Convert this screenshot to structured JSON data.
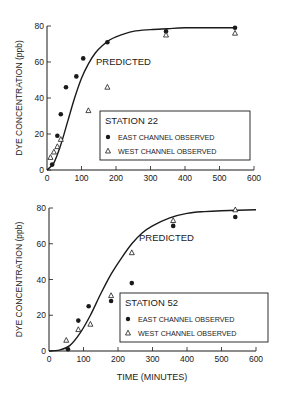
{
  "chart_data": [
    {
      "type": "scatter",
      "title": "STATION 22",
      "xlabel": "",
      "ylabel": "DYE CONCENTRATION (ppb)",
      "xlim": [
        0,
        600
      ],
      "ylim": [
        0,
        80
      ],
      "xticks": [
        "0",
        "100",
        "200",
        "300",
        "400",
        "500",
        "600"
      ],
      "yticks": [
        "0",
        "20",
        "40",
        "60",
        "80"
      ],
      "grid": false,
      "legend_position": "lower right",
      "annotation": "PREDICTED",
      "legend": {
        "title": "STATION 22",
        "east_label": "EAST CHANNEL OBSERVED",
        "west_label": "WEST CHANNEL OBSERVED"
      },
      "series": [
        {
          "name": "EAST CHANNEL OBSERVED",
          "marker": "filled-circle",
          "x": [
            15,
            30,
            40,
            55,
            85,
            105,
            175,
            345,
            545
          ],
          "y": [
            3,
            19,
            31,
            46,
            52,
            62,
            71,
            77,
            79
          ]
        },
        {
          "name": "WEST CHANNEL OBSERVED",
          "marker": "open-triangle",
          "x": [
            10,
            20,
            30,
            40,
            120,
            175,
            345,
            545
          ],
          "y": [
            7,
            10,
            13,
            17,
            33,
            46,
            75,
            76
          ]
        },
        {
          "name": "PREDICTED",
          "marker": "line",
          "x": [
            0,
            20,
            40,
            60,
            80,
            100,
            120,
            140,
            160,
            180,
            200,
            250,
            300,
            350,
            400,
            500,
            550
          ],
          "y": [
            0,
            4,
            14,
            27,
            40,
            51,
            59,
            65,
            69,
            72,
            74,
            77,
            78,
            78.5,
            79,
            79,
            79
          ]
        }
      ]
    },
    {
      "type": "scatter",
      "title": "STATION 52",
      "xlabel": "TIME (MINUTES)",
      "ylabel": "DYE CONCENTRATION (ppb)",
      "xlim": [
        0,
        600
      ],
      "ylim": [
        0,
        80
      ],
      "xticks": [
        "0",
        "100",
        "200",
        "300",
        "400",
        "500",
        "600"
      ],
      "yticks": [
        "0",
        "20",
        "40",
        "60",
        "80"
      ],
      "grid": false,
      "legend_position": "lower right",
      "annotation": "PREDICTED",
      "legend": {
        "title": "STATION 52",
        "east_label": "EAST CHANNEL OBSERVED",
        "west_label": "WEST CHANNEL OBSERVED"
      },
      "series": [
        {
          "name": "EAST CHANNEL OBSERVED",
          "marker": "filled-circle",
          "x": [
            55,
            85,
            115,
            180,
            240,
            360,
            540
          ],
          "y": [
            1,
            17,
            25,
            28,
            38,
            70,
            75
          ]
        },
        {
          "name": "WEST CHANNEL OBSERVED",
          "marker": "open-triangle",
          "x": [
            50,
            85,
            120,
            180,
            240,
            360,
            540
          ],
          "y": [
            6,
            12,
            15,
            31,
            55,
            73,
            79
          ]
        },
        {
          "name": "PREDICTED",
          "marker": "line",
          "x": [
            0,
            30,
            60,
            90,
            120,
            150,
            180,
            210,
            240,
            270,
            300,
            350,
            400,
            450,
            500,
            600
          ],
          "y": [
            0,
            0.5,
            3,
            10,
            20,
            32,
            43,
            52,
            60,
            66,
            70,
            74.5,
            77,
            78,
            78.5,
            79
          ]
        }
      ]
    }
  ]
}
